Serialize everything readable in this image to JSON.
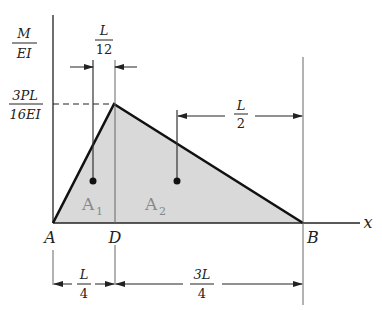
{
  "diagram": {
    "type": "moment-area diagram (M/EI)",
    "axis_y_label": {
      "num": "M",
      "den": "EI"
    },
    "axis_x_label": "x",
    "peak_label": {
      "num": "3PL",
      "den": "16EI"
    },
    "points": {
      "A": "A",
      "D": "D",
      "B": "B"
    },
    "areas": {
      "A1": {
        "base": "A",
        "sub": "1"
      },
      "A2": {
        "base": "A",
        "sub": "2"
      }
    },
    "dimensions": {
      "L_over_12": {
        "num": "L",
        "den": "12"
      },
      "L_over_2": {
        "num": "L",
        "den": "2"
      },
      "L_over_4": {
        "num": "L",
        "den": "4"
      },
      "3L_over_4": {
        "num": "3L",
        "den": "4"
      }
    },
    "colors": {
      "fill": "#d9d9d9",
      "line": "#111111",
      "thin": "#555555"
    }
  }
}
